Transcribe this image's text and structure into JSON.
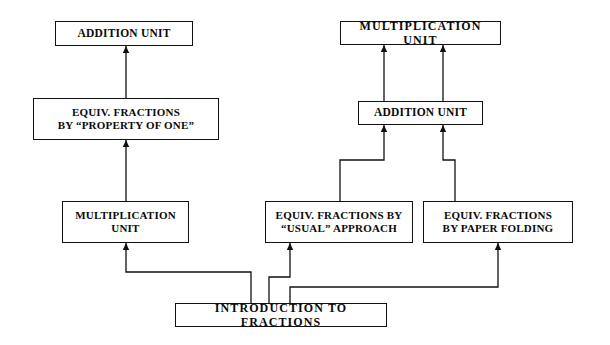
{
  "diagram": {
    "background_color": "#ffffff",
    "line_color": "#111111",
    "text_color": "#0a0a0a",
    "nodes": [
      {
        "id": "addition-unit-left",
        "label": "ADDITION UNIT",
        "x": 55,
        "y": 21,
        "w": 138,
        "h": 25,
        "lines": 1
      },
      {
        "id": "equiv-fractions-property-of-one",
        "label": "EQUIV. FRACTIONS\nBY “PROPERTY OF ONE”",
        "x": 33,
        "y": 98,
        "w": 186,
        "h": 42,
        "lines": 2
      },
      {
        "id": "multiplication-unit-left",
        "label": "MULTIPLICATION\nUNIT",
        "x": 62,
        "y": 201,
        "w": 127,
        "h": 42,
        "lines": 2
      },
      {
        "id": "multiplication-unit-right",
        "label": "MULTIPLICATION UNIT",
        "x": 340,
        "y": 21,
        "w": 161,
        "h": 24,
        "lines": 1
      },
      {
        "id": "addition-unit-right",
        "label": "ADDITION UNIT",
        "x": 358,
        "y": 101,
        "w": 125,
        "h": 24,
        "lines": 1
      },
      {
        "id": "equiv-fractions-usual-approach",
        "label": "EQUIV. FRACTIONS BY\n“USUAL” APPROACH",
        "x": 265,
        "y": 201,
        "w": 148,
        "h": 42,
        "lines": 2
      },
      {
        "id": "equiv-fractions-paper-folding",
        "label": "EQUIV. FRACTIONS\nBY PAPER FOLDING",
        "x": 423,
        "y": 201,
        "w": 150,
        "h": 42,
        "lines": 2
      },
      {
        "id": "introduction-to-fractions",
        "label": "INTRODUCTION TO FRACTIONS",
        "x": 175,
        "y": 303,
        "w": 212,
        "h": 24,
        "lines": 1
      }
    ],
    "edges": [
      {
        "id": "edge-mult-left-to-equiv-property",
        "from": "multiplication-unit-left",
        "to": "equiv-fractions-property-of-one",
        "path": "M126,201 L126,140",
        "arrow_at": [
          126,
          140
        ]
      },
      {
        "id": "edge-equiv-property-to-addition-left",
        "from": "equiv-fractions-property-of-one",
        "to": "addition-unit-left",
        "path": "M126,98 L126,46",
        "arrow_at": [
          126,
          46
        ]
      },
      {
        "id": "edge-intro-to-mult-left",
        "from": "introduction-to-fractions",
        "to": "multiplication-unit-left",
        "path": "M251,303 L251,272 L126,272 L126,243",
        "arrow_at": [
          126,
          243
        ]
      },
      {
        "id": "edge-intro-to-equiv-usual",
        "from": "introduction-to-fractions",
        "to": "equiv-fractions-usual-approach",
        "path": "M269,303 L269,277 L290,277 L290,243",
        "arrow_at": [
          290,
          243
        ]
      },
      {
        "id": "edge-intro-to-equiv-paper-folding",
        "from": "introduction-to-fractions",
        "to": "equiv-fractions-paper-folding",
        "path": "M290,303 L290,287 L498,287 L498,243",
        "arrow_at": [
          498,
          243
        ]
      },
      {
        "id": "edge-equiv-usual-to-addition-right",
        "from": "equiv-fractions-usual-approach",
        "to": "addition-unit-right",
        "path": "M340,201 L340,160 L384,160 L384,125",
        "arrow_at": [
          384,
          125
        ]
      },
      {
        "id": "edge-equiv-paper-folding-to-addition-right",
        "from": "equiv-fractions-paper-folding",
        "to": "addition-unit-right",
        "path": "M455,201 L455,160 L443,160 L443,125",
        "arrow_at": [
          443,
          125
        ]
      },
      {
        "id": "edge-addition-right-to-mult-right-a",
        "from": "addition-unit-right",
        "to": "multiplication-unit-right",
        "path": "M384,101 L384,45",
        "arrow_at": [
          384,
          45
        ]
      },
      {
        "id": "edge-addition-right-to-mult-right-b",
        "from": "addition-unit-right",
        "to": "multiplication-unit-right",
        "path": "M443,101 L443,45",
        "arrow_at": [
          443,
          45
        ]
      }
    ]
  }
}
